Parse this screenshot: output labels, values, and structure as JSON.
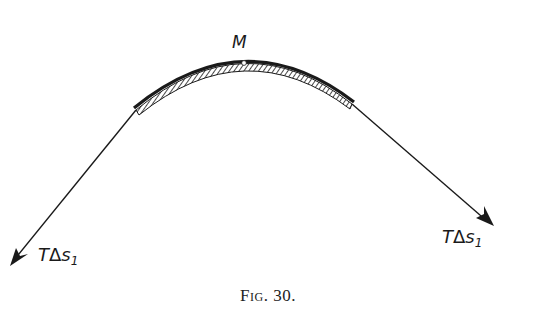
{
  "figure": {
    "point_label": "M",
    "left_force_label": {
      "symbol": "T",
      "delta": "Δ",
      "var": "s",
      "subscript": "1"
    },
    "right_force_label": {
      "symbol": "T",
      "delta": "Δ",
      "var": "s",
      "subscript": "1"
    },
    "caption": "Fig. 30.",
    "colors": {
      "ink": "#1a1a1a",
      "background": "#ffffff"
    }
  },
  "diagram": {
    "type": "force diagram",
    "elements": [
      "curved string element (arc) with hatched segment",
      "apex point M",
      "tangent force vector to lower-left",
      "tangent force vector to lower-right"
    ]
  }
}
